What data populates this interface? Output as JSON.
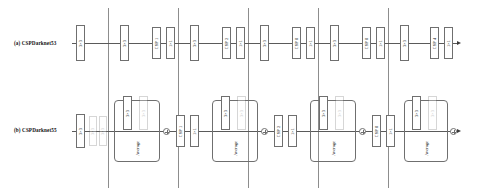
{
  "figure": {
    "rows": [
      {
        "tag": "(a) CSPDarknet53",
        "name": "row-a",
        "stages": [
          {
            "blocks": [
              {
                "label": "3×3"
              }
            ]
          },
          {
            "blocks": [
              {
                "label": "3×3"
              },
              {
                "label": "CSP 1"
              },
              {
                "label": "1×1"
              }
            ]
          },
          {
            "blocks": [
              {
                "label": "3×3"
              },
              {
                "label": "CSP 2"
              },
              {
                "label": "1×1"
              }
            ]
          },
          {
            "blocks": [
              {
                "label": "3×3"
              },
              {
                "label": "CSP 8"
              },
              {
                "label": "1×1"
              }
            ]
          },
          {
            "blocks": [
              {
                "label": "3×3"
              },
              {
                "label": "CSP 8"
              },
              {
                "label": "1×1"
              }
            ]
          },
          {
            "blocks": [
              {
                "label": "3×3"
              },
              {
                "label": "CSP 4"
              },
              {
                "label": "1×1"
              }
            ]
          }
        ]
      },
      {
        "tag": "(b) CSPDarknet55",
        "name": "row-b",
        "stages": [
          {
            "blocks": [
              {
                "label": "3×3"
              },
              {
                "label": "3×3"
              },
              {
                "label": "3×3"
              }
            ]
          },
          {
            "average": {
              "label": "Average",
              "branches": [
                {
                  "label": "3×3"
                },
                {
                  "label": "3×3"
                }
              ]
            },
            "merge": "plus",
            "blocks": [
              {
                "label": "CSP 1"
              },
              {
                "label": "1×1"
              }
            ]
          },
          {
            "average": {
              "label": "Average",
              "branches": [
                {
                  "label": "3×3"
                },
                {
                  "label": "3×3"
                }
              ]
            },
            "merge": "plus",
            "blocks": [
              {
                "label": "CSP 2"
              },
              {
                "label": "1×1"
              }
            ]
          },
          {
            "average": {
              "label": "Average",
              "branches": [
                {
                  "label": "3×3"
                },
                {
                  "label": "3×3"
                }
              ]
            },
            "merge": "plus",
            "blocks": [
              {
                "label": "CSP 8"
              },
              {
                "label": "1×1"
              }
            ]
          },
          {
            "average": {
              "label": "Average",
              "branches": [
                {
                  "label": "3×3"
                },
                {
                  "label": "3×3"
                }
              ]
            },
            "merge": "plus",
            "blocks": [
              {
                "label": "CSP 8"
              },
              {
                "label": "1×1"
              }
            ]
          },
          {
            "average": {
              "label": "Average",
              "branches": [
                {
                  "label": "3×3"
                },
                {
                  "label": "3×3"
                }
              ]
            },
            "merge": "plus",
            "blocks": [
              {
                "label": "CSP 4"
              },
              {
                "label": "1×1"
              }
            ]
          }
        ]
      }
    ],
    "separators_x": [
      108,
      178,
      248,
      318,
      388
    ],
    "colors": {
      "stroke": "#6f6f6f",
      "separator": "#8d8d8d",
      "text": "#111111",
      "background": "#ffffff"
    }
  }
}
